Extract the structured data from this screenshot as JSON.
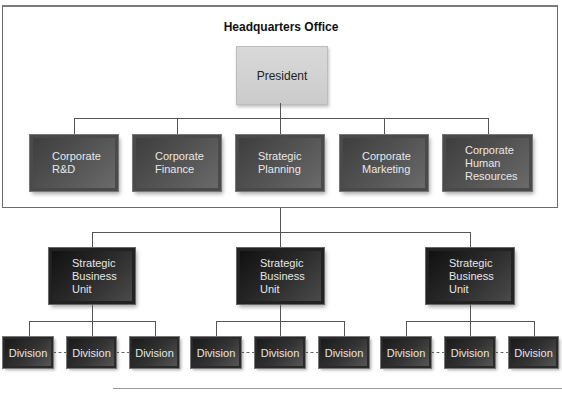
{
  "headquarters": {
    "title": "Headquarters Office",
    "president": "President",
    "departments": [
      {
        "label": "Corporate\nR&D"
      },
      {
        "label": "Corporate\nFinance"
      },
      {
        "label": "Strategic\nPlanning"
      },
      {
        "label": "Corporate\nMarketing"
      },
      {
        "label": "Corporate\nHuman\nResources"
      }
    ]
  },
  "business_units": [
    {
      "label": "Strategic\nBusiness\nUnit",
      "divisions": [
        "Division",
        "Division",
        "Division"
      ]
    },
    {
      "label": "Strategic\nBusiness\nUnit",
      "divisions": [
        "Division",
        "Division",
        "Division"
      ]
    },
    {
      "label": "Strategic\nBusiness\nUnit",
      "divisions": [
        "Division",
        "Division",
        "Division"
      ]
    }
  ],
  "colors": {
    "president_fill": "#d0d0d0",
    "department_fill": "#555555",
    "sbu_fill": "#222222",
    "division_fill": "#333333",
    "connector": "#555555"
  }
}
